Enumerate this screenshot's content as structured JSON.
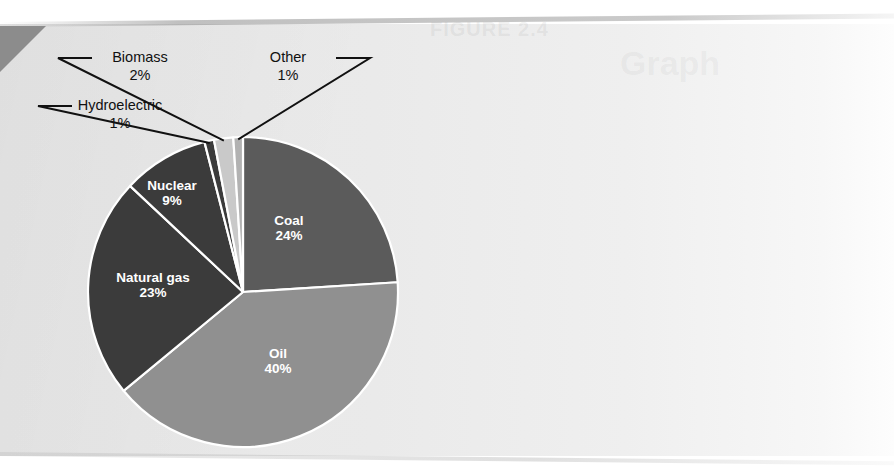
{
  "figure": {
    "background_color": "#e9e9e9",
    "paper_white": "#ffffff",
    "ghost_title": "FIGURE 2.4",
    "ghost_subtitle": "Graph"
  },
  "chart_data": {
    "type": "pie",
    "title": "",
    "subtitle": "",
    "xlabel": "",
    "ylabel": "",
    "grid": false,
    "legend_position": "none",
    "start_angle_deg": 0,
    "direction": "clockwise",
    "total_percent": 100,
    "categories": [
      "Coal",
      "Oil",
      "Natural gas",
      "Nuclear",
      "Hydroelectric",
      "Biomass",
      "Other"
    ],
    "values": [
      24,
      40,
      23,
      9,
      1,
      2,
      1
    ],
    "slices": [
      {
        "label": "Coal",
        "value_text": "24%",
        "value": 24,
        "color": "#5b5b5b",
        "label_placement": "inside",
        "label_color": "#ffffff",
        "label_x": 289,
        "label_y": 225
      },
      {
        "label": "Oil",
        "value_text": "40%",
        "value": 40,
        "color": "#909090",
        "label_placement": "inside",
        "label_color": "#ffffff",
        "label_x": 278,
        "label_y": 358
      },
      {
        "label": "Natural gas",
        "value_text": "23%",
        "value": 23,
        "color": "#3b3b3b",
        "label_placement": "inside",
        "label_color": "#ffffff",
        "label_x": 153,
        "label_y": 282
      },
      {
        "label": "Nuclear",
        "value_text": "9%",
        "value": 9,
        "color": "#3b3b3b",
        "label_placement": "inside",
        "label_color": "#ffffff",
        "label_x": 172,
        "label_y": 190
      },
      {
        "label": "Hydroelectric",
        "value_text": "1%",
        "value": 1,
        "color": "#3b3b3b",
        "label_placement": "callout-left",
        "label_color": "#111111",
        "label_x": 120,
        "label_y": 110
      },
      {
        "label": "Biomass",
        "value_text": "2%",
        "value": 2,
        "color": "#c9c9c9",
        "label_placement": "callout-left",
        "label_color": "#111111",
        "label_x": 140,
        "label_y": 62
      },
      {
        "label": "Other",
        "value_text": "1%",
        "value": 1,
        "color": "#b2b2b2",
        "label_placement": "callout-right",
        "label_color": "#111111",
        "label_x": 288,
        "label_y": 62
      }
    ],
    "geometry": {
      "center_x": 243,
      "center_y": 292,
      "radius": 155,
      "separator_color": "#ffffff",
      "separator_width": 2.2
    }
  }
}
